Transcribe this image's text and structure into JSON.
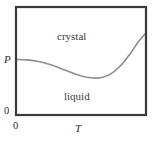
{
  "figure": {
    "kind": "phase-diagram",
    "background_color": "#ffffff",
    "frame_color": "#3a3a3a",
    "curve_color": "#8d8d8d"
  },
  "axes": {
    "y_axis_label": "P",
    "x_axis_label": "T",
    "y_origin_tick": "0",
    "x_origin_tick": "0"
  },
  "regions": {
    "upper_label": "crystal",
    "lower_label": "liquid"
  },
  "chart_data": {
    "type": "line",
    "title": "",
    "xlabel": "T",
    "ylabel": "P",
    "xlim": [
      0,
      1
    ],
    "ylim": [
      0,
      1
    ],
    "grid": false,
    "legend": null,
    "annotations": [
      {
        "text": "crystal",
        "x": 0.37,
        "y": 0.78
      },
      {
        "text": "liquid",
        "x": 0.42,
        "y": 0.25
      }
    ],
    "tick_labels": {
      "x": [
        "0"
      ],
      "y": [
        "0",
        "P"
      ]
    },
    "series": [
      {
        "name": "melting-curve",
        "color": "#8d8d8d",
        "x": [
          0.0,
          0.08,
          0.16,
          0.24,
          0.32,
          0.4,
          0.48,
          0.56,
          0.64,
          0.72,
          0.8,
          0.88,
          0.94,
          1.0
        ],
        "y": [
          0.515,
          0.51,
          0.497,
          0.475,
          0.443,
          0.406,
          0.371,
          0.347,
          0.343,
          0.374,
          0.451,
          0.57,
          0.676,
          0.76
        ]
      }
    ]
  }
}
